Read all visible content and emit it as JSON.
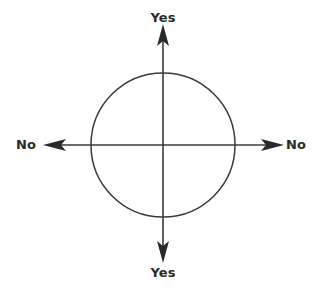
{
  "diagram": {
    "type": "axes-with-circle",
    "labels": {
      "top": "Yes",
      "bottom": "Yes",
      "left": "No",
      "right": "No"
    },
    "colors": {
      "line": "#3a3a3a",
      "arrowhead": "#2a2a2a",
      "text": "#2a2a2a",
      "background": "#ffffff"
    }
  }
}
